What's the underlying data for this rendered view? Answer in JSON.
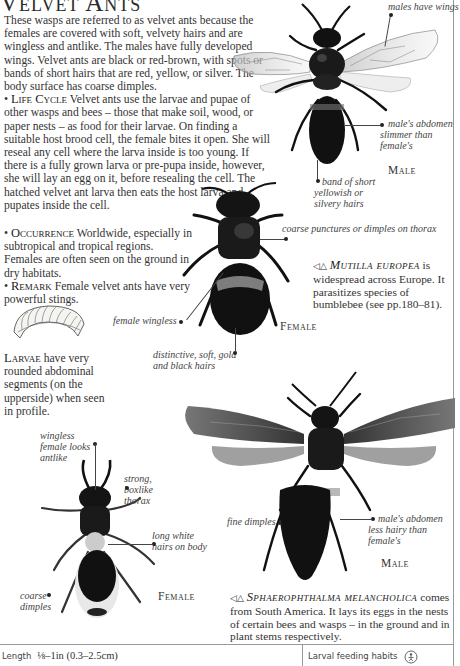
{
  "page": {
    "title": "Velvet Ants",
    "intro": "These wasps are referred to as velvet ants because the females are covered with soft, velvety hairs and are wingless and antlike. The males have fully developed wings. Velvet ants are black or red-brown, with spots or bands of short hairs that are red, yellow, or silver. The body surface has coarse dimples.",
    "sections": [
      {
        "heading": "Life Cycle",
        "text": "Velvet ants use the larvae and pupae of other wasps and bees – those that make soil, wood, or paper nests – as food for their larvae. On finding a suitable host brood cell, the female bites it open. She will reseal any cell where the larva inside is too young. If there is a fully grown larva or pre-pupa inside, however, she will lay an egg on it, before resealing the cell. The hatched velvet ant larva then eats the host larva and pupates inside the cell."
      },
      {
        "heading": "Occurrence",
        "text": "Worldwide, especially in subtropical and tropical regions. Females are often seen on the ground in dry habitats."
      },
      {
        "heading": "Remark",
        "text": "Female velvet ants have very powerful stings."
      }
    ],
    "larvae": {
      "heading": "Larvae",
      "text": "have very rounded abdominal segments (on the upperside) when seen in profile."
    }
  },
  "specimens": {
    "mutilla_male": {
      "label": "Male",
      "captions": [
        "males have wings",
        "male's abdomen slimmer than female's",
        "band of short yellowish or silvery hairs"
      ]
    },
    "mutilla_female": {
      "label": "Female",
      "captions": [
        "coarse punctures or dimples on thorax",
        "female wingless",
        "distinctive, soft, gold and black hairs"
      ]
    },
    "sphaero_female": {
      "label": "Female",
      "captions": [
        "wingless female looks antlike",
        "strong, boxlike thorax",
        "long white hairs on body",
        "coarse dimples"
      ]
    },
    "sphaero_male": {
      "label": "Male",
      "captions": [
        "fine dimples",
        "male's abdomen less hairy than female's"
      ]
    }
  },
  "species_notes": {
    "mutilla": {
      "symbols": "◁△",
      "name": "Mutilla europea",
      "text": "is widespread across Europe. It parasitizes species of bumblebee (see pp.180–81)."
    },
    "sphaero": {
      "symbols": "◁△",
      "name": "Sphaerophthalma melancholica",
      "text": "comes from South America. It lays its eggs in the nests of certain bees and wasps – in the ground and in plant stems respectively."
    }
  },
  "footer": {
    "length_label": "Length",
    "length_value": "⅛–1in (0.3–2.5cm)",
    "habits_label": "Larval feeding habits",
    "habits_icon": "parasite-icon"
  }
}
